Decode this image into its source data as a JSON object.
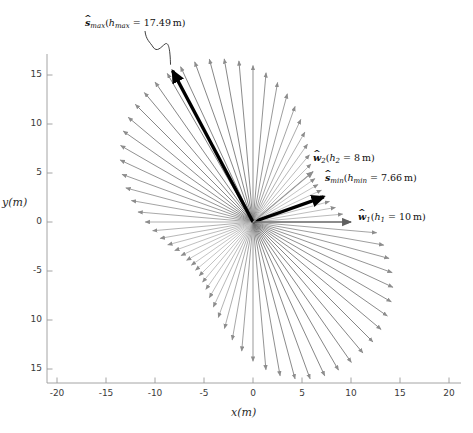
{
  "figure": {
    "kind": "quiver-polar-vector-field",
    "background": "#ffffff"
  },
  "axes": {
    "x_title": "x(m)",
    "y_title": "y(m)",
    "x_ticks": [
      "-20",
      "-15",
      "-10",
      "-5",
      "0",
      "5",
      "10",
      "15",
      "20"
    ],
    "x_tick_values": [
      -20,
      -15,
      -10,
      -5,
      0,
      5,
      10,
      15,
      20
    ],
    "y_ticks": [
      "15",
      "10",
      "5",
      "0",
      "-5",
      "10",
      "15"
    ],
    "y_tick_values": [
      15,
      10,
      5,
      0,
      -5,
      -10,
      -15
    ],
    "xlim": [
      -21.8,
      21.2
    ],
    "ylim": [
      -16.8,
      16.6
    ],
    "grid": false,
    "box": false,
    "axis_color": "#8a8a8a",
    "tick_color": "#3a3a3a"
  },
  "annotations": [
    {
      "name": "s-max",
      "symbol": "s",
      "symbol_sub": "max",
      "param": "h",
      "param_sub": "max",
      "equals": "=",
      "value": "17.49",
      "unit": "m",
      "text": "ŝmax(hmax = 17.49 m)",
      "x_px": 85,
      "y_px": 17,
      "leader": true,
      "color": "#000000"
    },
    {
      "name": "w2",
      "symbol": "w",
      "symbol_sub": "2",
      "param": "h",
      "param_sub": "2",
      "equals": "=",
      "value": "8",
      "unit": "m",
      "text": "ŵ2(h2 = 8 m)",
      "x_px": 313,
      "y_px": 152,
      "leader": false,
      "color": "#000000"
    },
    {
      "name": "s-min",
      "symbol": "s",
      "symbol_sub": "min",
      "param": "h",
      "param_sub": "min",
      "equals": "=",
      "value": "7.66",
      "unit": "m",
      "text": "ŝmin(hmin = 7.66 m)",
      "x_px": 325,
      "y_px": 172,
      "leader": false,
      "color": "#000000"
    },
    {
      "name": "w1",
      "symbol": "w",
      "symbol_sub": "1",
      "param": "h",
      "param_sub": "1",
      "equals": "=",
      "value": "10",
      "unit": "m",
      "text": "ŵ1(h1 = 10 m)",
      "x_px": 358,
      "y_px": 211,
      "leader": false,
      "color": "#000000"
    }
  ],
  "chart_data": {
    "type": "scatter",
    "subtype": "quiver",
    "title": "",
    "xlabel": "x(m)",
    "ylabel": "y(m)",
    "xlim": [
      -21.8,
      21.2
    ],
    "ylim": [
      -16.8,
      16.6
    ],
    "grid": false,
    "legend": "none",
    "origin": [
      0,
      0
    ],
    "envelope": {
      "h_max": 17.49,
      "h_min": 7.66,
      "h_max_angle_deg": 118.0,
      "h_min_angle_deg": 19.5
    },
    "highlighted_vectors": [
      {
        "name": "s_max",
        "label": "ŝmax",
        "h": 17.49,
        "angle_deg": 118.0,
        "x": -8.21,
        "y": 15.44,
        "color": "#000000",
        "width": 3.4,
        "style": "thick-black"
      },
      {
        "name": "s_min",
        "label": "ŝmin",
        "h": 7.66,
        "angle_deg": 19.5,
        "x": 7.22,
        "y": 2.56,
        "color": "#000000",
        "width": 3.4,
        "style": "thick-black"
      },
      {
        "name": "w_1",
        "label": "ŵ1",
        "h": 10.0,
        "angle_deg": 0.0,
        "x": 10.0,
        "y": 0.0,
        "color": "#707070",
        "width": 1.6,
        "style": "gray"
      },
      {
        "name": "w_2",
        "label": "ŵ2",
        "h": 8.0,
        "angle_deg": 40.0,
        "x": 6.13,
        "y": 5.14,
        "color": "#9a9a9a",
        "width": 1.2,
        "style": "gray"
      }
    ],
    "n_arrows": 72,
    "angle_step_deg": 5,
    "angles_deg": [
      0,
      5,
      10,
      15,
      20,
      25,
      30,
      35,
      40,
      45,
      50,
      55,
      60,
      65,
      70,
      75,
      80,
      85,
      90,
      95,
      100,
      105,
      110,
      115,
      120,
      125,
      130,
      135,
      140,
      145,
      150,
      155,
      160,
      165,
      170,
      175,
      180,
      185,
      190,
      195,
      200,
      205,
      210,
      215,
      220,
      225,
      230,
      235,
      240,
      245,
      250,
      255,
      260,
      265,
      270,
      275,
      280,
      285,
      290,
      295,
      300,
      305,
      310,
      315,
      320,
      325,
      330,
      335,
      340,
      345,
      350,
      355
    ],
    "magnitudes": [
      10.0,
      9.19,
      8.54,
      8.08,
      7.82,
      7.7,
      7.66,
      7.72,
      7.95,
      8.36,
      8.95,
      9.7,
      10.58,
      11.55,
      12.55,
      13.54,
      14.46,
      15.28,
      15.96,
      16.5,
      16.9,
      17.2,
      17.39,
      17.48,
      17.49,
      17.41,
      17.24,
      16.98,
      16.62,
      16.16,
      15.6,
      14.95,
      14.22,
      13.43,
      12.6,
      11.78,
      11.0,
      10.28,
      9.62,
      9.01,
      8.5,
      8.1,
      7.83,
      7.68,
      7.66,
      7.77,
      8.01,
      8.39,
      8.92,
      9.58,
      10.36,
      11.25,
      12.22,
      13.22,
      14.21,
      15.13,
      15.93,
      16.57,
      17.03,
      17.31,
      17.45,
      17.49,
      17.44,
      17.3,
      17.06,
      16.73,
      16.29,
      15.75,
      15.11,
      14.37,
      13.55,
      12.67
    ],
    "arrow_color_min": "#b9b9b9",
    "arrow_color_max": "#6f6f6f"
  }
}
